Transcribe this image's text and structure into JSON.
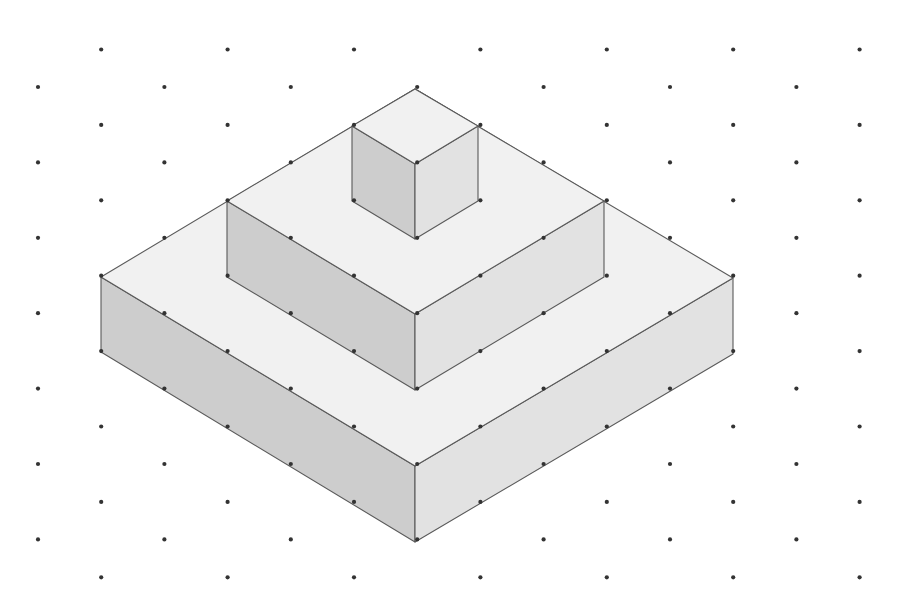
{
  "diagram": {
    "type": "isometric-solid",
    "grid": {
      "x0": 38,
      "dx": 63.2,
      "columns": 14,
      "y_even_col_start": 87,
      "y_odd_col_start": 49.5,
      "dy": 75.4,
      "rows": 8,
      "dot_radius": 2.1,
      "dot_color": "#333333"
    },
    "colors": {
      "top_face": "#f1f1f1",
      "left_face": "#cdcdcd",
      "right_face": "#e2e2e2",
      "edge": "#5a5a5a",
      "background": "#ffffff"
    },
    "tiers": [
      {
        "name": "bottom-tier",
        "size": "5x5x1",
        "top": [
          [
            415,
            89
          ],
          [
            733,
            278
          ],
          [
            415,
            466
          ],
          [
            101,
            277
          ]
        ],
        "left_face": [
          [
            101,
            277
          ],
          [
            415,
            466
          ],
          [
            415,
            542
          ],
          [
            101,
            352
          ]
        ],
        "right_face": [
          [
            415,
            466
          ],
          [
            733,
            278
          ],
          [
            733,
            354
          ],
          [
            415,
            542
          ]
        ]
      },
      {
        "name": "middle-tier",
        "size": "3x3x1",
        "top": [
          [
            415,
            89
          ],
          [
            604,
            201
          ],
          [
            415,
            314
          ],
          [
            227,
            201
          ]
        ],
        "left_face": [
          [
            227,
            201
          ],
          [
            415,
            314
          ],
          [
            415,
            390
          ],
          [
            227,
            277
          ]
        ],
        "right_face": [
          [
            415,
            314
          ],
          [
            604,
            201
          ],
          [
            604,
            277
          ],
          [
            415,
            390
          ]
        ]
      },
      {
        "name": "top-cube",
        "size": "1x1x1",
        "top": [
          [
            415,
            89
          ],
          [
            478,
            126
          ],
          [
            415,
            164
          ],
          [
            352,
            126
          ]
        ],
        "left_face": [
          [
            352,
            126
          ],
          [
            415,
            164
          ],
          [
            415,
            239
          ],
          [
            352,
            201
          ]
        ],
        "right_face": [
          [
            415,
            164
          ],
          [
            478,
            126
          ],
          [
            478,
            201
          ],
          [
            415,
            239
          ]
        ]
      }
    ]
  }
}
